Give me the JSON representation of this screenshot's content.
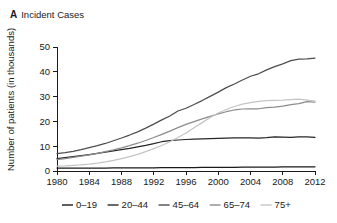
{
  "panel": {
    "letter": "A",
    "title": "Incident Cases"
  },
  "chart_data": {
    "type": "line",
    "title": "Incident Cases",
    "xlabel": "",
    "ylabel": "Number of patients (in thousands)",
    "xlim": [
      1980,
      2012
    ],
    "ylim": [
      0,
      50
    ],
    "xticks": [
      1980,
      1984,
      1988,
      1992,
      1996,
      2000,
      2004,
      2008,
      2012
    ],
    "yticks": [
      0,
      10,
      20,
      30,
      40,
      50
    ],
    "grid": false,
    "legend_position": "bottom",
    "x": [
      1980,
      1981,
      1982,
      1983,
      1984,
      1985,
      1986,
      1987,
      1988,
      1989,
      1990,
      1991,
      1992,
      1993,
      1994,
      1995,
      1996,
      1997,
      1998,
      1999,
      2000,
      2001,
      2002,
      2003,
      2004,
      2005,
      2006,
      2007,
      2008,
      2009,
      2010,
      2011,
      2012
    ],
    "series": [
      {
        "name": "0-19",
        "label": "0–19",
        "color": "#1a1a1a",
        "values": [
          1.2,
          1.2,
          1.2,
          1.2,
          1.2,
          1.2,
          1.2,
          1.3,
          1.3,
          1.3,
          1.3,
          1.3,
          1.3,
          1.4,
          1.4,
          1.4,
          1.4,
          1.4,
          1.5,
          1.5,
          1.5,
          1.5,
          1.5,
          1.6,
          1.6,
          1.6,
          1.6,
          1.6,
          1.7,
          1.7,
          1.7,
          1.7,
          1.7
        ]
      },
      {
        "name": "20-44",
        "label": "20–44",
        "color": "#262626",
        "values": [
          5.0,
          5.4,
          5.8,
          6.2,
          6.6,
          7.1,
          7.6,
          8.1,
          8.6,
          9.1,
          9.7,
          10.3,
          11.0,
          11.8,
          12.2,
          12.5,
          12.7,
          12.9,
          13.0,
          13.1,
          13.2,
          13.3,
          13.4,
          13.4,
          13.4,
          13.3,
          13.5,
          13.8,
          13.7,
          13.6,
          13.8,
          13.8,
          13.6
        ]
      },
      {
        "name": "45-64",
        "label": "45–64",
        "color": "#4d4d4d",
        "values": [
          7.0,
          7.4,
          7.9,
          8.6,
          9.4,
          10.2,
          11.1,
          12.2,
          13.3,
          14.5,
          15.8,
          17.3,
          18.9,
          20.6,
          22.2,
          24.2,
          25.3,
          26.8,
          28.4,
          30.1,
          31.8,
          33.6,
          35.1,
          36.7,
          38.2,
          39.2,
          40.8,
          42.1,
          43.2,
          44.5,
          45.1,
          45.2,
          45.5
        ]
      },
      {
        "name": "65-74",
        "label": "65–74",
        "color": "#8c8c8c",
        "values": [
          4.6,
          5.0,
          5.5,
          6.0,
          6.5,
          7.1,
          7.8,
          8.5,
          9.3,
          10.2,
          11.2,
          12.3,
          13.5,
          14.8,
          16.1,
          17.5,
          18.8,
          19.9,
          21.0,
          22.0,
          23.0,
          23.9,
          24.6,
          25.0,
          25.1,
          25.1,
          25.6,
          25.8,
          26.2,
          26.8,
          27.2,
          28.0,
          27.8
        ]
      },
      {
        "name": "75+",
        "label": "75+",
        "color": "#c4c4c4",
        "values": [
          2.0,
          2.1,
          2.3,
          2.5,
          2.8,
          3.2,
          3.7,
          4.3,
          5.0,
          5.8,
          6.7,
          7.8,
          9.0,
          10.3,
          11.8,
          13.5,
          15.3,
          17.4,
          19.5,
          21.6,
          23.4,
          24.8,
          26.0,
          27.0,
          27.6,
          28.1,
          28.4,
          28.5,
          28.6,
          28.8,
          29.0,
          28.6,
          28.2
        ]
      }
    ]
  },
  "legend": {
    "items": [
      {
        "label": "0–19",
        "color": "#1a1a1a"
      },
      {
        "label": "20–44",
        "color": "#262626"
      },
      {
        "label": "45–64",
        "color": "#4d4d4d"
      },
      {
        "label": "65–74",
        "color": "#8c8c8c"
      },
      {
        "label": "75+",
        "color": "#c4c4c4"
      }
    ]
  }
}
